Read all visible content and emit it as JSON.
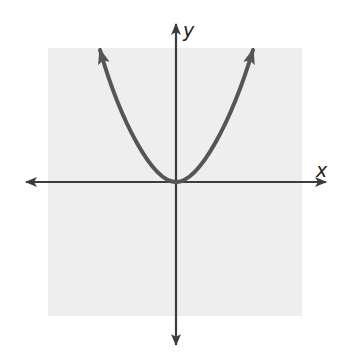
{
  "diagram": {
    "axes": {
      "x_label": "x",
      "y_label": "y"
    },
    "curve": {
      "type": "parabola",
      "equation": "y = x^2",
      "vertex": [
        0,
        0
      ],
      "opens": "up",
      "arrowheads": "both ends"
    },
    "colors": {
      "background": "#ffffff",
      "plot_area": "#eeeeee",
      "axes": "#3c3c3c",
      "curve": "#555555",
      "label": "#1e1e1e"
    }
  }
}
